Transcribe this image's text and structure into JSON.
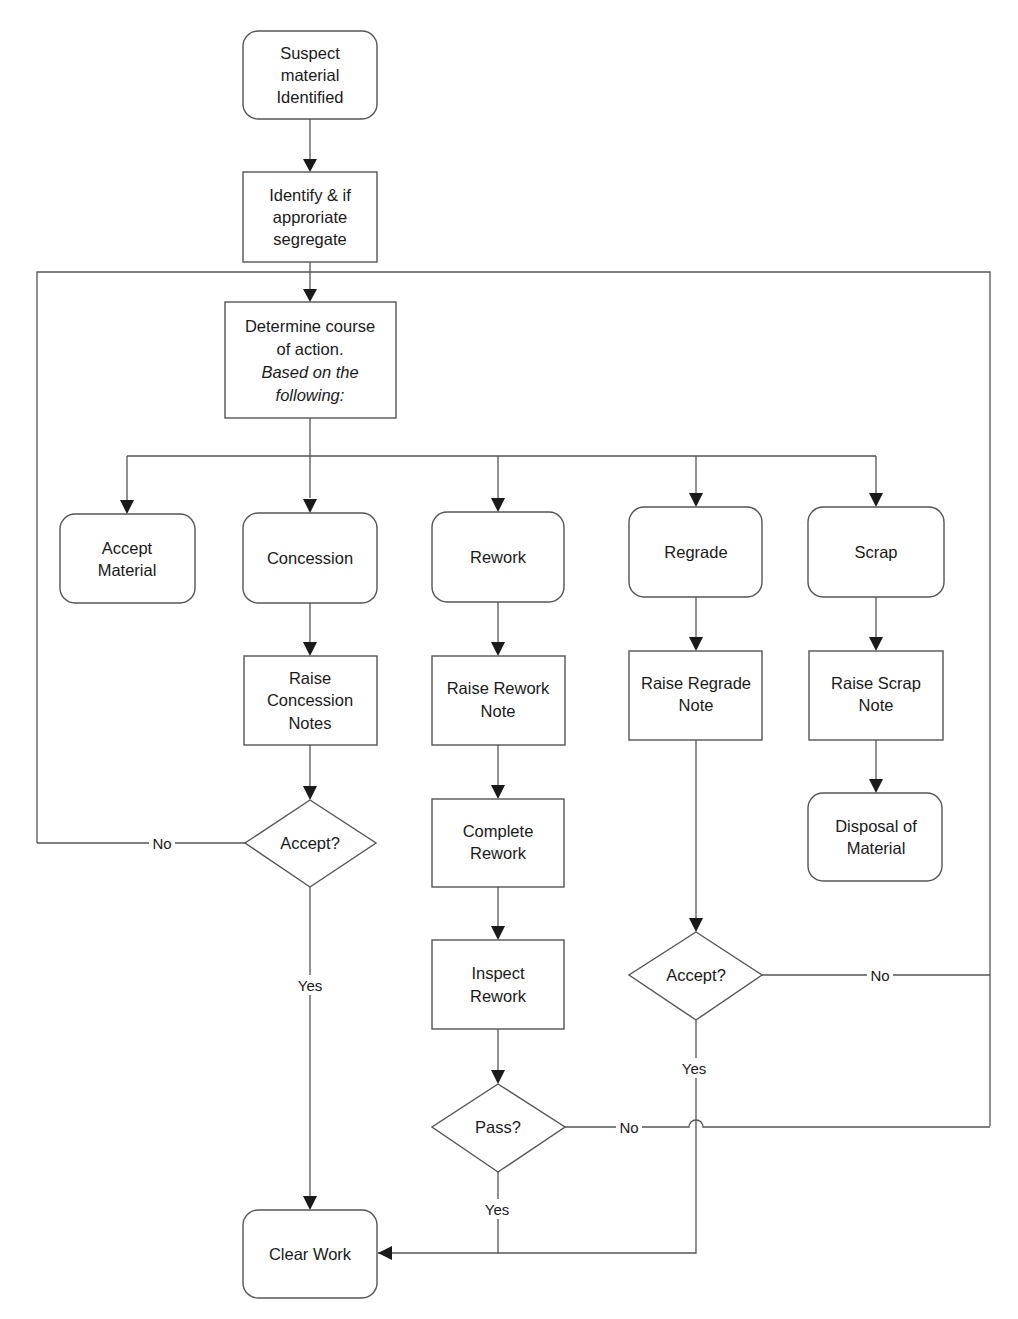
{
  "diagram": {
    "type": "flowchart",
    "nodes": {
      "suspect": {
        "shape": "rounded-rect",
        "lines": [
          "Suspect",
          "material",
          "Identified"
        ]
      },
      "identify": {
        "shape": "rect",
        "lines": [
          "Identify & if",
          "approriate",
          "segregate"
        ]
      },
      "determine": {
        "shape": "rect",
        "lines": [
          "Determine course",
          "of action."
        ],
        "italic_lines": [
          "Based on the",
          "following:"
        ]
      },
      "accept_material": {
        "shape": "rounded-rect",
        "lines": [
          "Accept",
          "Material"
        ]
      },
      "concession": {
        "shape": "rounded-rect",
        "lines": [
          "Concession"
        ]
      },
      "rework": {
        "shape": "rounded-rect",
        "lines": [
          "Rework"
        ]
      },
      "regrade": {
        "shape": "rounded-rect",
        "lines": [
          "Regrade"
        ]
      },
      "scrap": {
        "shape": "rounded-rect",
        "lines": [
          "Scrap"
        ]
      },
      "raise_concession": {
        "shape": "rect",
        "lines": [
          "Raise",
          "Concession",
          "Notes"
        ]
      },
      "raise_rework": {
        "shape": "rect",
        "lines": [
          "Raise Rework",
          "Note"
        ]
      },
      "raise_regrade": {
        "shape": "rect",
        "lines": [
          "Raise Regrade",
          "Note"
        ]
      },
      "raise_scrap": {
        "shape": "rect",
        "lines": [
          "Raise Scrap",
          "Note"
        ]
      },
      "complete_rework": {
        "shape": "rect",
        "lines": [
          "Complete",
          "Rework"
        ]
      },
      "disposal": {
        "shape": "rounded-rect",
        "lines": [
          "Disposal of",
          "Material"
        ]
      },
      "concession_accept": {
        "shape": "diamond",
        "lines": [
          "Accept?"
        ]
      },
      "inspect_rework": {
        "shape": "rect",
        "lines": [
          "Inspect",
          "Rework"
        ]
      },
      "regrade_accept": {
        "shape": "diamond",
        "lines": [
          "Accept?"
        ]
      },
      "pass": {
        "shape": "diamond",
        "lines": [
          "Pass?"
        ]
      },
      "clear_work": {
        "shape": "rounded-rect",
        "lines": [
          "Clear Work"
        ]
      }
    },
    "edge_labels": {
      "concession_no": "No",
      "concession_yes": "Yes",
      "regrade_no": "No",
      "regrade_yes": "Yes",
      "pass_no": "No",
      "pass_yes": "Yes"
    },
    "colors": {
      "stroke": "#555555",
      "text": "#1a1a1a",
      "background": "#ffffff"
    }
  }
}
